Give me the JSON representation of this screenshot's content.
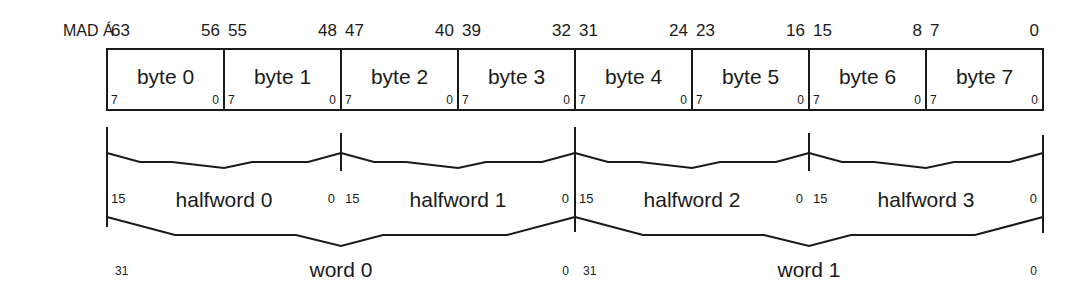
{
  "diagram": {
    "prefix_label": "MAD Á",
    "line_color": "#1a1a1a",
    "bytes": [
      {
        "label": "byte 0",
        "hi_bit": "63",
        "lo_bit": "56",
        "inner_hi": "7",
        "inner_lo": "0"
      },
      {
        "label": "byte 1",
        "hi_bit": "55",
        "lo_bit": "48",
        "inner_hi": "7",
        "inner_lo": "0"
      },
      {
        "label": "byte 2",
        "hi_bit": "47",
        "lo_bit": "40",
        "inner_hi": "7",
        "inner_lo": "0"
      },
      {
        "label": "byte 3",
        "hi_bit": "39",
        "lo_bit": "32",
        "inner_hi": "7",
        "inner_lo": "0"
      },
      {
        "label": "byte 4",
        "hi_bit": "31",
        "lo_bit": "24",
        "inner_hi": "7",
        "inner_lo": "0"
      },
      {
        "label": "byte 5",
        "hi_bit": "23",
        "lo_bit": "16",
        "inner_hi": "7",
        "inner_lo": "0"
      },
      {
        "label": "byte 6",
        "hi_bit": "15",
        "lo_bit": "8",
        "inner_hi": "7",
        "inner_lo": "0"
      },
      {
        "label": "byte 7",
        "hi_bit": "7",
        "lo_bit": "0",
        "inner_hi": "7",
        "inner_lo": "0"
      }
    ],
    "halfwords": [
      {
        "label": "halfword 0",
        "hi_bit": "15",
        "lo_bit": "0"
      },
      {
        "label": "halfword 1",
        "hi_bit": "15",
        "lo_bit": "0"
      },
      {
        "label": "halfword 2",
        "hi_bit": "15",
        "lo_bit": "0"
      },
      {
        "label": "halfword 3",
        "hi_bit": "15",
        "lo_bit": "0"
      }
    ],
    "words": [
      {
        "label": "word 0",
        "hi_bit": "31",
        "lo_bit": "0"
      },
      {
        "label": "word 1",
        "hi_bit": "31",
        "lo_bit": "0"
      }
    ]
  }
}
